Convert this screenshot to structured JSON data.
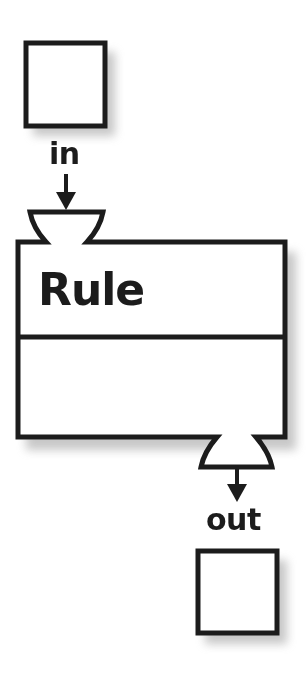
{
  "diagram": {
    "type": "rule-block",
    "input_label": "in",
    "output_label": "out",
    "rule": {
      "title": "Rule",
      "sections": [
        "header",
        "body"
      ]
    },
    "nodes": [
      {
        "id": "input-box",
        "kind": "square",
        "position": "top-left"
      },
      {
        "id": "rule-block",
        "kind": "rectangle",
        "title": "Rule"
      },
      {
        "id": "output-box",
        "kind": "square",
        "position": "bottom-right"
      }
    ],
    "edges": [
      {
        "from": "input-box",
        "to": "rule-block",
        "label": "in",
        "port": "top-input-cup"
      },
      {
        "from": "rule-block",
        "to": "output-box",
        "label": "out",
        "port": "bottom-output-cup"
      }
    ],
    "colors": {
      "stroke": "#1c1c1c",
      "fill": "#ffffff",
      "shadow": "#bdbdbd"
    }
  }
}
